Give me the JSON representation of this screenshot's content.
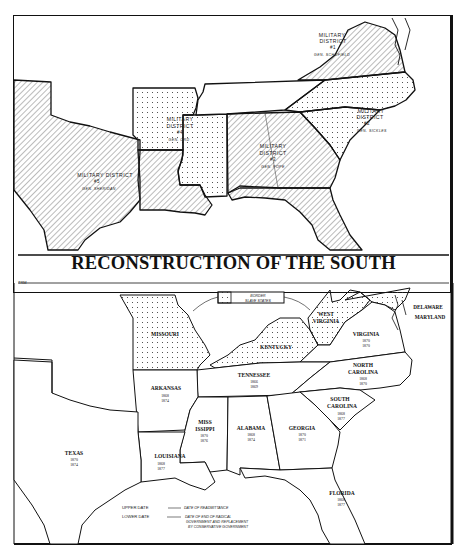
{
  "title": "RECONSTRUCTION OF THE SOUTH",
  "signature": "TRM",
  "top_map": {
    "districts": [
      {
        "id": "district-1",
        "name": "MILITARY DISTRICT",
        "number": "#1",
        "general": "GEN. SCHOFIELD",
        "states": [
          "Virginia"
        ],
        "pattern": "hatch"
      },
      {
        "id": "district-2",
        "name": "MILITARY DISTRICT",
        "number": "#2",
        "general": "GEN. SICKLES",
        "states": [
          "North Carolina",
          "South Carolina"
        ],
        "pattern": "dots"
      },
      {
        "id": "district-3",
        "name": "MILITARY DISTRICT",
        "number": "#3",
        "general": "GEN. POPE",
        "states": [
          "Georgia",
          "Alabama",
          "Florida"
        ],
        "pattern": "hatch"
      },
      {
        "id": "district-4",
        "name": "MILITARY DISTRICT",
        "number": "#4",
        "general": "GEN. ORD",
        "states": [
          "Arkansas",
          "Mississippi"
        ],
        "pattern": "dots"
      },
      {
        "id": "district-5",
        "name": "MILITARY DISTRICT",
        "number": "#5",
        "general": "GEN. SHERIDAN",
        "states": [
          "Texas",
          "Louisiana"
        ],
        "pattern": "hatch"
      }
    ],
    "labels": {
      "d1_line1": "MILITARY",
      "d1_line2": "DISTRICT",
      "d1_num": "#1",
      "d1_gen": "GEN. SCHOFIELD",
      "d2_line1": "MILITARY",
      "d2_line2": "DISTRICT",
      "d2_num": "#2",
      "d2_gen": "GEN. SICKLES",
      "d3_line1": "MILITARY",
      "d3_line2": "DISTRICT",
      "d3_num": "#3",
      "d3_gen": "GEN. POPE",
      "d4_line1": "MILITARY",
      "d4_line2": "DISTRICT",
      "d4_num": "#4",
      "d4_gen": "GEN. ORD",
      "d5_line1": "MILITARY  DISTRICT",
      "d5_num": "#5",
      "d5_gen": "GEN. SHERIDAN"
    }
  },
  "bottom_map": {
    "legend_box": {
      "line1": "BORDER",
      "line2": "SLAVE STATES"
    },
    "border_states": [
      "MISSOURI",
      "KENTUCKY",
      "WEST VIRGINIA",
      "MARYLAND",
      "DELAWARE"
    ],
    "states": [
      {
        "name": "TEXAS",
        "readmitted": "1870",
        "end_radical": "1874"
      },
      {
        "name": "ARKANSAS",
        "readmitted": "1868",
        "end_radical": "1874"
      },
      {
        "name": "LOUISIANA",
        "readmitted": "1868",
        "end_radical": "1877"
      },
      {
        "name": "MISS ISSIPPI",
        "line1": "MISS",
        "line2": "ISSIPPI",
        "readmitted": "1870",
        "end_radical": "1876"
      },
      {
        "name": "ALABAMA",
        "readmitted": "1868",
        "end_radical": "1874"
      },
      {
        "name": "GEORGIA",
        "readmitted": "1870",
        "end_radical": "1871"
      },
      {
        "name": "TENNESSEE",
        "readmitted": "1866",
        "end_radical": "1869"
      },
      {
        "name": "FLORIDA",
        "readmitted": "1868",
        "end_radical": "1877"
      },
      {
        "name": "SOUTH CAROLINA",
        "line1": "SOUTH",
        "line2": "CAROLINA",
        "readmitted": "1868",
        "end_radical": "1877"
      },
      {
        "name": "NORTH CAROLINA",
        "line1": "NORTH",
        "line2": "CAROLINA",
        "readmitted": "1868",
        "end_radical": "1870"
      },
      {
        "name": "VIRGINIA",
        "readmitted": "1870",
        "end_radical": "1870"
      }
    ],
    "other_labels": {
      "missouri": "MISSOURI",
      "kentucky": "KENTUCKY",
      "wv_line1": "WEST",
      "wv_line2": "VIRGINIA",
      "delaware": "DELAWARE",
      "maryland": "MARYLAND"
    },
    "key": {
      "upper_label": "UPPER DATE",
      "upper_desc": "DATE OF READMITTANCE",
      "lower_label": "LOWER DATE",
      "lower_desc_1": "DATE OF END OF RADICAL",
      "lower_desc_2": "GOVERNMENT AND REPLACEMENT",
      "lower_desc_3": "BY CONSERVATIVE GOVERNMENT"
    }
  },
  "colors": {
    "ink": "#111111",
    "paper": "#ffffff",
    "hatch": "#555555",
    "dots": "#444444"
  }
}
